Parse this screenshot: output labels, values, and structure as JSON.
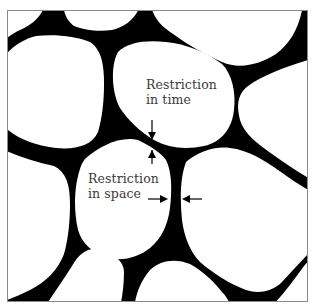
{
  "diagram": {
    "labels": {
      "restriction_time": {
        "line1": "Restriction",
        "line2": "in time"
      },
      "restriction_space": {
        "line1": "Restriction",
        "line2": "in space"
      }
    },
    "icons": {
      "arrow_down": "arrow-down-icon",
      "arrow_up": "arrow-up-icon",
      "arrow_right": "arrow-right-icon",
      "arrow_left": "arrow-left-icon"
    },
    "colors": {
      "network": "#000000",
      "cell": "#ffffff",
      "frame": "#8a8a8a",
      "text": "#3a3a3a"
    }
  }
}
